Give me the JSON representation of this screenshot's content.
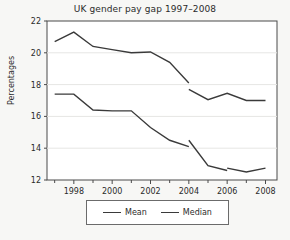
{
  "chart_data": {
    "type": "line",
    "title": "UK gender pay gap 1997–2008",
    "xlabel": "",
    "ylabel": "Percentages",
    "xlim": [
      1996.6,
      2008.6
    ],
    "ylim": [
      12,
      22
    ],
    "grid": true,
    "legend_position": "bottom",
    "xticks": [
      1998,
      2000,
      2002,
      2004,
      2006,
      2008
    ],
    "xtick_labels": [
      "1998",
      "2000",
      "2002",
      "2004",
      "2006",
      "2008"
    ],
    "xminor_ticks": [
      1997,
      1999,
      2001,
      2003,
      2005,
      2007
    ],
    "yticks": [
      12,
      14,
      16,
      18,
      20,
      22
    ],
    "ytick_labels": [
      "12",
      "14",
      "16",
      "18",
      "20",
      "22"
    ],
    "series": [
      {
        "name": "Mean",
        "x": [
          1997,
          1998,
          1999,
          2000,
          2001,
          2002,
          2003,
          2004
        ],
        "values": [
          20.7,
          21.3,
          20.4,
          20.2,
          20.0,
          20.05,
          19.4,
          18.1
        ]
      },
      {
        "name": "Mean",
        "x": [
          2004,
          2005,
          2006,
          2007,
          2008
        ],
        "values": [
          17.7,
          17.05,
          17.45,
          17.0,
          17.0
        ]
      },
      {
        "name": "Median",
        "x": [
          1997,
          1998,
          1999,
          2000,
          2001,
          2002,
          2003,
          2004
        ],
        "values": [
          17.4,
          17.4,
          16.4,
          16.35,
          16.35,
          15.3,
          14.5,
          14.1
        ]
      },
      {
        "name": "Median",
        "x": [
          2004,
          2005,
          2006
        ],
        "values": [
          14.5,
          12.9,
          12.6
        ]
      },
      {
        "name": "Median",
        "x": [
          2006,
          2007,
          2008
        ],
        "values": [
          12.75,
          12.5,
          12.75
        ]
      }
    ]
  },
  "legend": {
    "entries": [
      {
        "label": "Mean"
      },
      {
        "label": "Median"
      }
    ]
  }
}
